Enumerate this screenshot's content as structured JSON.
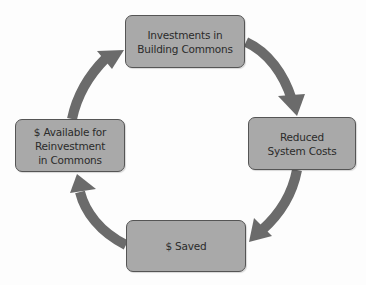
{
  "diagram": {
    "type": "cycle",
    "nodes": [
      {
        "id": "top",
        "lines": [
          "Investments in",
          "Building Commons"
        ]
      },
      {
        "id": "right",
        "lines": [
          "Reduced",
          "System Costs"
        ]
      },
      {
        "id": "bottom",
        "lines": [
          "$ Saved"
        ]
      },
      {
        "id": "left",
        "lines": [
          "$ Available for",
          "Reinvestment",
          "in Commons"
        ]
      }
    ],
    "edges": [
      {
        "from": "top",
        "to": "right",
        "direction": "clockwise"
      },
      {
        "from": "right",
        "to": "bottom",
        "direction": "clockwise"
      },
      {
        "from": "bottom",
        "to": "left",
        "direction": "clockwise"
      },
      {
        "from": "left",
        "to": "top",
        "direction": "clockwise"
      }
    ],
    "colors": {
      "node_fill": "#a9a9a9",
      "node_border": "#555555",
      "arrow": "#6b6b6b",
      "text": "#2b2b2b",
      "background": "#ffffff"
    }
  }
}
